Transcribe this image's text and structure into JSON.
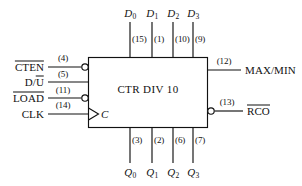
{
  "diagram": {
    "kind": "logic-symbol",
    "device_title": "CTR DIV 10",
    "clock_glyph": "C",
    "colors": {
      "line": "#111111",
      "background": "#ffffff",
      "text": "#111111"
    },
    "data_inputs": [
      {
        "name": "D",
        "subscript": "0",
        "pin": "(15)"
      },
      {
        "name": "D",
        "subscript": "1",
        "pin": "(1)"
      },
      {
        "name": "D",
        "subscript": "2",
        "pin": "(10)"
      },
      {
        "name": "D",
        "subscript": "3",
        "pin": "(9)"
      }
    ],
    "control_inputs": [
      {
        "label": "CTEN",
        "overbar": "full",
        "pin": "(4)",
        "bubble": true
      },
      {
        "label": "D/U",
        "overbar": "partial-U",
        "pin": "(5)",
        "bubble": false
      },
      {
        "label": "LOAD",
        "overbar": "full",
        "pin": "(11)",
        "bubble": true
      },
      {
        "label": "CLK",
        "overbar": "none",
        "pin": "(14)",
        "bubble": false,
        "dynamic": true
      }
    ],
    "outputs_right": [
      {
        "label": "MAX/MIN",
        "overbar": "none",
        "pin": "(12)",
        "bubble": false
      },
      {
        "label": "RCO",
        "overbar": "full",
        "pin": "(13)",
        "bubble": true
      }
    ],
    "outputs_bottom": [
      {
        "name": "Q",
        "subscript": "0",
        "pin": "(3)"
      },
      {
        "name": "Q",
        "subscript": "1",
        "pin": "(2)"
      },
      {
        "name": "Q",
        "subscript": "2",
        "pin": "(6)"
      },
      {
        "name": "Q",
        "subscript": "3",
        "pin": "(7)"
      }
    ]
  }
}
